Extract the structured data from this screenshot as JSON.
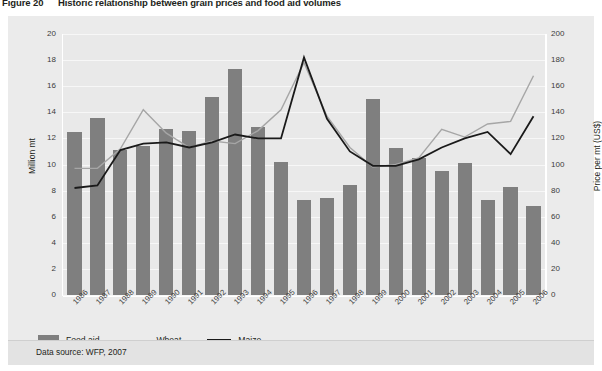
{
  "figure": {
    "number": "Figure 20",
    "title": "Historic relationship between grain prices and food aid volumes"
  },
  "footer": {
    "source": "Data source: WFP, 2007"
  },
  "legend": {
    "food_aid": "Food aid",
    "wheat": "Wheat",
    "maize": "Maize"
  },
  "colors": {
    "bar": "#7f7f7f",
    "wheat_line": "#a6a6a6",
    "maize_line": "#1a1a1a",
    "panel": "#ebebeb",
    "plot": "#e9e9e9",
    "gridline": "#f7f7f7"
  },
  "chart_data": {
    "type": "bar",
    "title": "Historic relationship between grain prices and food aid volumes",
    "xlabel": "",
    "ylabel": "Million mt",
    "y2label": "Price per mt (US$)",
    "ylim": [
      0,
      20
    ],
    "y2lim": [
      0,
      200
    ],
    "yticks": [
      0,
      2,
      4,
      6,
      8,
      10,
      12,
      14,
      16,
      18,
      20
    ],
    "y2ticks": [
      0,
      20,
      40,
      60,
      80,
      100,
      120,
      140,
      160,
      180,
      200
    ],
    "grid": true,
    "legend_position": "below-plot",
    "categories": [
      "1986",
      "1987",
      "1988",
      "1989",
      "1990",
      "1991",
      "1992",
      "1993",
      "1994",
      "1995",
      "1996",
      "1997",
      "1998",
      "1999",
      "2000",
      "2001",
      "2002",
      "2003",
      "2004",
      "2005",
      "2006"
    ],
    "series": [
      {
        "name": "Food aid",
        "type": "bar",
        "axis": "left",
        "unit": "Million mt",
        "values": [
          12.5,
          13.6,
          11.1,
          11.4,
          12.7,
          12.6,
          15.2,
          17.3,
          12.9,
          10.2,
          7.3,
          7.4,
          8.4,
          15.0,
          11.3,
          10.5,
          9.5,
          10.1,
          7.3,
          8.3,
          6.8
        ]
      },
      {
        "name": "Wheat",
        "type": "line",
        "axis": "right",
        "unit": "US$ per mt",
        "values": [
          97,
          97,
          112,
          142,
          124,
          113,
          118,
          116,
          126,
          142,
          178,
          137,
          113,
          98,
          100,
          105,
          127,
          121,
          131,
          133,
          168
        ]
      },
      {
        "name": "Maize",
        "type": "line",
        "axis": "right",
        "unit": "US$ per mt",
        "values": [
          82,
          84,
          111,
          116,
          117,
          113,
          117,
          123,
          120,
          120,
          182,
          135,
          110,
          99,
          99,
          104,
          113,
          120,
          125,
          108,
          137
        ]
      }
    ]
  }
}
